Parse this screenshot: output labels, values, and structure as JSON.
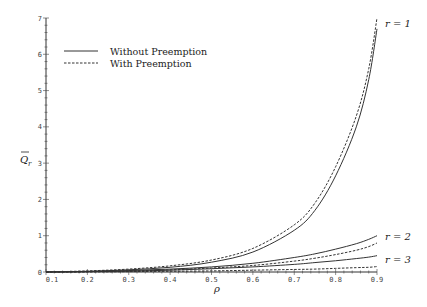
{
  "chart_data": {
    "type": "line",
    "title": "",
    "xlabel": "ρ",
    "ylabel": "Q̄_r",
    "xlim": [
      0.1,
      0.9
    ],
    "ylim": [
      0,
      7
    ],
    "xticks": [
      "0.1",
      "0.2",
      "0.3",
      "0.4",
      "0.5",
      "0.6",
      "0.7",
      "0.8",
      "0.9"
    ],
    "yticks": [
      "0",
      "1",
      "2",
      "3",
      "4",
      "5",
      "6",
      "7"
    ],
    "grid": false,
    "legend": {
      "position": "upper-left",
      "entries": [
        {
          "label": "Without Preemption",
          "style": "solid"
        },
        {
          "label": "With Preemption",
          "style": "dashed"
        }
      ]
    },
    "x": [
      0.1,
      0.2,
      0.3,
      0.4,
      0.5,
      0.6,
      0.7,
      0.75,
      0.8,
      0.85,
      0.88,
      0.9
    ],
    "series": [
      {
        "name": "r = 1, Without Preemption",
        "r": 1,
        "style": "solid",
        "values": [
          0.0,
          0.02,
          0.06,
          0.13,
          0.27,
          0.55,
          1.15,
          1.7,
          2.65,
          4.0,
          5.3,
          6.7
        ]
      },
      {
        "name": "r = 1, With Preemption",
        "r": 1,
        "style": "dashed",
        "values": [
          0.0,
          0.03,
          0.08,
          0.17,
          0.33,
          0.65,
          1.3,
          1.9,
          2.9,
          4.3,
          5.6,
          7.0
        ]
      },
      {
        "name": "r = 2, Without Preemption",
        "r": 2,
        "style": "solid",
        "values": [
          0.0,
          0.01,
          0.04,
          0.08,
          0.14,
          0.24,
          0.4,
          0.5,
          0.63,
          0.78,
          0.9,
          1.0
        ]
      },
      {
        "name": "r = 2, With Preemption",
        "r": 2,
        "style": "dashed",
        "values": [
          0.0,
          0.01,
          0.03,
          0.06,
          0.11,
          0.18,
          0.3,
          0.38,
          0.48,
          0.6,
          0.7,
          0.8
        ]
      },
      {
        "name": "r = 3, Without Preemption",
        "r": 3,
        "style": "solid",
        "values": [
          0.0,
          0.01,
          0.02,
          0.05,
          0.09,
          0.14,
          0.21,
          0.26,
          0.31,
          0.37,
          0.41,
          0.45
        ]
      },
      {
        "name": "r = 3, With Preemption",
        "r": 3,
        "style": "dashed",
        "values": [
          0.0,
          0.0,
          0.01,
          0.02,
          0.03,
          0.05,
          0.07,
          0.08,
          0.1,
          0.12,
          0.13,
          0.15
        ]
      }
    ],
    "annotations": [
      {
        "text": "r = 1",
        "x": 0.9,
        "y": 6.85
      },
      {
        "text": "r = 2",
        "x": 0.9,
        "y": 0.95
      },
      {
        "text": "r = 3",
        "x": 0.9,
        "y": 0.4
      }
    ]
  },
  "axis": {
    "xlabel": "ρ",
    "ylabel": "Q",
    "ylabel_sub": "r"
  }
}
